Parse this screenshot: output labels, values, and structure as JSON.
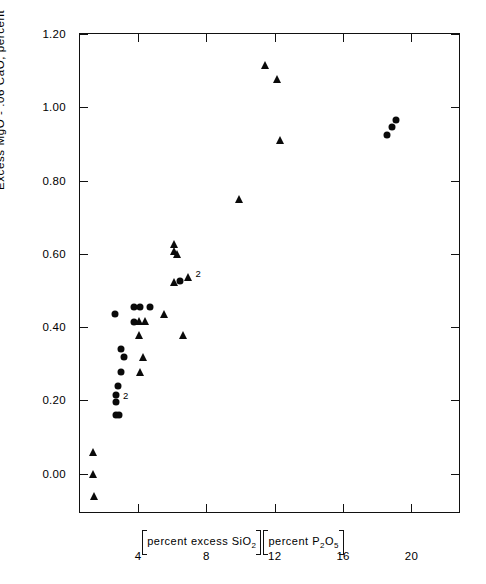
{
  "chart_data": {
    "type": "scatter",
    "title": "",
    "xlabel": "[percent excess SiO2][percent P2O5]",
    "ylabel": "Excess MgO - .06 CaO, percent",
    "xlim": [
      0.6,
      22.9
    ],
    "ylim": [
      -0.11,
      1.2
    ],
    "grid": false,
    "legend_position": "none",
    "x_ticks": [
      {
        "value": 4,
        "label": "4"
      },
      {
        "value": 8,
        "label": "8"
      },
      {
        "value": 12,
        "label": "12"
      },
      {
        "value": 16,
        "label": "16"
      },
      {
        "value": 20,
        "label": "20"
      }
    ],
    "y_ticks": [
      {
        "value": 1.2,
        "label": "1.20"
      },
      {
        "value": 1.0,
        "label": "1.00"
      },
      {
        "value": 0.8,
        "label": "0.80"
      },
      {
        "value": 0.6,
        "label": "0.60"
      },
      {
        "value": 0.4,
        "label": "0.40"
      },
      {
        "value": 0.2,
        "label": "0.20"
      },
      {
        "value": 0.0,
        "label": "0.00"
      }
    ],
    "series": [
      {
        "name": "circle-series",
        "marker": "circle",
        "color": "#0a0a0a",
        "points": [
          {
            "x": 2.62,
            "y": 0.435
          },
          {
            "x": 3.78,
            "y": 0.455
          },
          {
            "x": 4.1,
            "y": 0.455
          },
          {
            "x": 4.72,
            "y": 0.455
          },
          {
            "x": 3.78,
            "y": 0.415
          },
          {
            "x": 2.98,
            "y": 0.34
          },
          {
            "x": 3.2,
            "y": 0.318
          },
          {
            "x": 3.02,
            "y": 0.278
          },
          {
            "x": 2.8,
            "y": 0.238
          },
          {
            "x": 2.72,
            "y": 0.215
          },
          {
            "x": 2.72,
            "y": 0.195
          },
          {
            "x": 2.7,
            "y": 0.16
          },
          {
            "x": 2.88,
            "y": 0.16
          },
          {
            "x": 6.45,
            "y": 0.525
          },
          {
            "x": 18.55,
            "y": 0.925
          },
          {
            "x": 18.85,
            "y": 0.945
          },
          {
            "x": 19.12,
            "y": 0.965
          }
        ]
      },
      {
        "name": "triangle-series",
        "marker": "triangle",
        "color": "#0a0a0a",
        "points": [
          {
            "x": 1.35,
            "y": 0.058
          },
          {
            "x": 1.38,
            "y": 0.0
          },
          {
            "x": 1.4,
            "y": -0.062
          },
          {
            "x": 4.05,
            "y": 0.418
          },
          {
            "x": 4.42,
            "y": 0.418
          },
          {
            "x": 5.5,
            "y": 0.435
          },
          {
            "x": 4.08,
            "y": 0.378
          },
          {
            "x": 6.62,
            "y": 0.378
          },
          {
            "x": 4.28,
            "y": 0.318
          },
          {
            "x": 4.1,
            "y": 0.278
          },
          {
            "x": 6.12,
            "y": 0.628
          },
          {
            "x": 6.12,
            "y": 0.608
          },
          {
            "x": 6.25,
            "y": 0.6
          },
          {
            "x": 6.12,
            "y": 0.522
          },
          {
            "x": 6.95,
            "y": 0.538
          },
          {
            "x": 9.92,
            "y": 0.75
          },
          {
            "x": 11.4,
            "y": 1.115
          },
          {
            "x": 12.12,
            "y": 1.078
          },
          {
            "x": 12.28,
            "y": 0.912
          }
        ]
      }
    ],
    "annotations": [
      {
        "text": "2",
        "x": 2.88,
        "y": 0.215,
        "note": "count label beside overlapping circles"
      },
      {
        "text": "2",
        "x": 7.12,
        "y": 0.548,
        "note": "count label beside overlapping triangles"
      }
    ]
  },
  "axis": {
    "y_title": "Excess  MgO - .06  CaO, percent",
    "x_title_part1_prefix": "percent  excess  SiO",
    "x_title_part1_sub": "2",
    "x_title_part2_prefix": "percent  P",
    "x_title_part2_sub1": "2",
    "x_title_part2_mid": "O",
    "x_title_part2_sub2": "5"
  }
}
